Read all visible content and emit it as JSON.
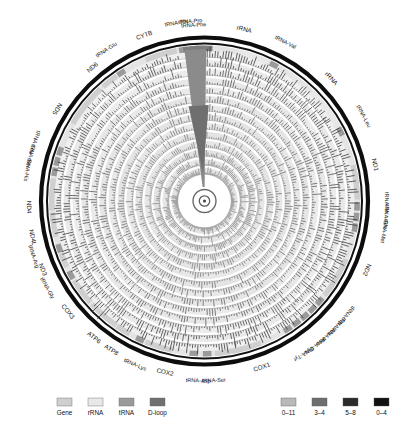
{
  "figure": {
    "title": "",
    "type": "circular-genome-coverage-plot",
    "background": "#ffffff"
  },
  "chart_data": {
    "type": "heatmap",
    "title": "",
    "subtitle": "",
    "xlabel": "",
    "ylabel": "",
    "grid": false,
    "legend_position": "bottom",
    "ring_count": 14,
    "ring_radii": [
      150,
      141,
      132,
      123,
      114,
      105,
      96,
      87,
      78,
      69,
      60,
      51,
      42,
      33
    ],
    "depth_bins": [
      "0–11",
      "3–4",
      "5–8",
      "0–4"
    ],
    "feature_labels_outer": [
      {
        "label": "tRNA-Phe",
        "angle": -2
      },
      {
        "label": "rRNA",
        "angle": 14
      },
      {
        "label": "tRNA-Val",
        "angle": 27
      },
      {
        "label": "rRNA",
        "angle": 46
      },
      {
        "label": "tRNA-Leu",
        "angle": 63
      },
      {
        "label": "ND1",
        "angle": 78
      },
      {
        "label": "tRNA-Ile",
        "angle": 92
      },
      {
        "label": "tRNA-Gln",
        "angle": 96
      },
      {
        "label": "tRNA-Met",
        "angle": 100
      },
      {
        "label": "ND2",
        "angle": 114
      },
      {
        "label": "tRNA-Trp",
        "angle": 131
      },
      {
        "label": "tRNA-Ala",
        "angle": 135
      },
      {
        "label": "tRNA-Asn",
        "angle": 139
      },
      {
        "label": "tRNA-Cys",
        "angle": 143
      },
      {
        "label": "tRNA-Tyr",
        "angle": 147
      },
      {
        "label": "COX1",
        "angle": 160
      },
      {
        "label": "tRNA-Ser",
        "angle": 179
      },
      {
        "label": "tRNA-Asp",
        "angle": 184
      },
      {
        "label": "COX2",
        "angle": 194
      },
      {
        "label": "tRNA-Lys",
        "angle": 205
      },
      {
        "label": "ATP8",
        "angle": 211
      },
      {
        "label": "ATP6",
        "angle": 217
      },
      {
        "label": "COX3",
        "angle": 230
      },
      {
        "label": "tRNA-Gly",
        "angle": 241
      },
      {
        "label": "ND3",
        "angle": 246
      },
      {
        "label": "tRNA-Arg",
        "angle": 252
      },
      {
        "label": "ND4L",
        "angle": 258
      },
      {
        "label": "ND4",
        "angle": 268
      },
      {
        "label": "tRNA-His",
        "angle": 281
      },
      {
        "label": "tRNA-Ser",
        "angle": 285
      },
      {
        "label": "tRNA-Leu",
        "angle": 289
      },
      {
        "label": "ND5",
        "angle": 302
      },
      {
        "label": "ND6",
        "angle": 320
      },
      {
        "label": "tRNA-Glu",
        "angle": 327
      },
      {
        "label": "CYTB",
        "angle": 339
      },
      {
        "label": "tRNA-Thr",
        "angle": 352
      },
      {
        "label": "tRNA-Pro",
        "angle": 356
      }
    ],
    "feature_track_colors": {
      "gene": "#cfcfcf",
      "rRNA": "#e8e8e8",
      "tRNA": "#9a9a9a",
      "D-loop": "#7d7d7d"
    }
  },
  "legend": {
    "feature_items": [
      {
        "label": "Gene",
        "color": "#cfcfcf"
      },
      {
        "label": "rRNA",
        "color": "#e8e8e8"
      },
      {
        "label": "tRNA",
        "color": "#9a9a9a"
      },
      {
        "label": "D-loop",
        "color": "#6f6f6f"
      }
    ],
    "depth_items": [
      {
        "label": "0–11",
        "color": "#b9b9b9"
      },
      {
        "label": "3–4",
        "color": "#6e6e6e"
      },
      {
        "label": "5–8",
        "color": "#2b2b2b"
      },
      {
        "label": "0–4",
        "color": "#111111"
      }
    ]
  },
  "outer_labels": [
    {
      "id": "trna-phe",
      "text": "tRNA-Phe",
      "angle": -3.5,
      "r": 176,
      "flip": false
    },
    {
      "id": "rrna-1",
      "text": "rRNA",
      "angle": 13.0,
      "r": 176,
      "flip": false
    },
    {
      "id": "trna-val",
      "text": "tRNA-Val",
      "angle": 27.0,
      "r": 178,
      "flip": false
    },
    {
      "id": "rrna-2",
      "text": "rRNA",
      "angle": 46.0,
      "r": 176,
      "flip": false
    },
    {
      "id": "trna-leu-1",
      "text": "tRNA-Leu",
      "angle": 62.0,
      "r": 180,
      "flip": false
    },
    {
      "id": "nd1",
      "text": "ND1",
      "angle": 78.0,
      "r": 174,
      "flip": false
    },
    {
      "id": "trna-ile",
      "text": "tRNA-Ile",
      "angle": 90.5,
      "r": 182,
      "flip": false
    },
    {
      "id": "trna-gln",
      "text": "tRNA-Gln",
      "angle": 95.0,
      "r": 182,
      "flip": false
    },
    {
      "id": "trna-met",
      "text": "tRNA-Met",
      "angle": 99.5,
      "r": 182,
      "flip": false
    },
    {
      "id": "nd2",
      "text": "ND2",
      "angle": 113.0,
      "r": 176,
      "flip": false
    },
    {
      "id": "trna-trp",
      "text": "tRNA-Trp",
      "angle": 129.0,
      "r": 182,
      "flip": false
    },
    {
      "id": "trna-ala",
      "text": "tRNA-Ala",
      "angle": 133.5,
      "r": 182,
      "flip": false
    },
    {
      "id": "trna-asn",
      "text": "tRNA-Asn",
      "angle": 138.0,
      "r": 182,
      "flip": false
    },
    {
      "id": "trna-cys",
      "text": "tRNA-Cys",
      "angle": 142.5,
      "r": 182,
      "flip": false
    },
    {
      "id": "trna-tyr",
      "text": "tRNA-Tyr",
      "angle": 147.0,
      "r": 182,
      "flip": false
    },
    {
      "id": "cox1",
      "text": "COX1",
      "angle": 161.0,
      "r": 176,
      "flip": true
    },
    {
      "id": "trna-ser-1",
      "text": "tRNA-Ser",
      "angle": 177.0,
      "r": 180,
      "flip": true
    },
    {
      "id": "trna-asp",
      "text": "tRNA-Asp",
      "angle": 182.0,
      "r": 180,
      "flip": true
    },
    {
      "id": "cox2",
      "text": "COX2",
      "angle": 193.0,
      "r": 176,
      "flip": true
    },
    {
      "id": "trna-lys",
      "text": "tRNA-Lys",
      "angle": 203.0,
      "r": 178,
      "flip": true
    },
    {
      "id": "atp8",
      "text": "ATP8",
      "angle": 212.0,
      "r": 176,
      "flip": true
    },
    {
      "id": "atp6",
      "text": "ATP6",
      "angle": 219.0,
      "r": 176,
      "flip": true
    },
    {
      "id": "cox3",
      "text": "COX3",
      "angle": 231.0,
      "r": 176,
      "flip": true
    },
    {
      "id": "trna-gly",
      "text": "tRNA-Gly",
      "angle": 241.0,
      "r": 180,
      "flip": true
    },
    {
      "id": "nd3",
      "text": "ND3",
      "angle": 247.0,
      "r": 176,
      "flip": true
    },
    {
      "id": "trna-arg",
      "text": "tRNA-Arg",
      "angle": 252.0,
      "r": 180,
      "flip": true
    },
    {
      "id": "nd4l",
      "text": "ND4L",
      "angle": 258.0,
      "r": 176,
      "flip": true
    },
    {
      "id": "nd4",
      "text": "ND4",
      "angle": 268.0,
      "r": 176,
      "flip": true
    },
    {
      "id": "trna-his",
      "text": "tRNA-His",
      "angle": 280.0,
      "r": 180,
      "flip": true
    },
    {
      "id": "trna-ser-2",
      "text": "tRNA-Ser",
      "angle": 284.5,
      "r": 180,
      "flip": true
    },
    {
      "id": "trna-leu-2",
      "text": "tRNA-Leu",
      "angle": 289.0,
      "r": 180,
      "flip": true
    },
    {
      "id": "nd5",
      "text": "ND5",
      "angle": 302.0,
      "r": 174,
      "flip": true
    },
    {
      "id": "nd6",
      "text": "ND6",
      "angle": 320.0,
      "r": 174,
      "flip": false
    },
    {
      "id": "trna-glu",
      "text": "tRNA-Glu",
      "angle": 327.0,
      "r": 180,
      "flip": false
    },
    {
      "id": "cytb",
      "text": "CYTB",
      "angle": 340.0,
      "r": 176,
      "flip": false
    },
    {
      "id": "trna-thr",
      "text": "tRNA-Thr",
      "angle": 351.0,
      "r": 180,
      "flip": false
    },
    {
      "id": "trna-pro",
      "text": "tRNA-Pro",
      "angle": 355.5,
      "r": 180,
      "flip": false
    }
  ]
}
